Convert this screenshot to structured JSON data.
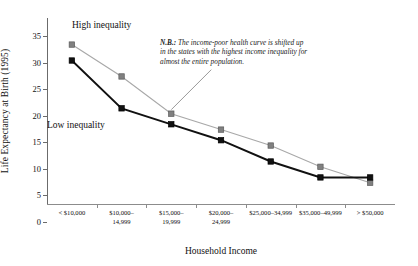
{
  "chart_data": {
    "type": "line",
    "title": "",
    "xlabel": "Household Income",
    "ylabel": "Life Expectancy at Birth (1995)",
    "ylim": [
      0,
      35
    ],
    "ytick_step": 5,
    "yticks": [
      "0",
      "5",
      "10",
      "15",
      "20",
      "25",
      "30",
      "35"
    ],
    "grid": false,
    "legend": "inline-labels",
    "categories": [
      "< $10,000",
      "$10,000–\n14,999",
      "$15,000–\n19,999",
      "$20,000–\n24,999",
      "$25,000–34,999",
      "$35,000–49,999",
      "> $50,000"
    ],
    "categories_flat": [
      "< $10,000",
      "$10,000–14,999",
      "$15,000–19,999",
      "$20,000–24,999",
      "$25,000–34,999",
      "$35,000–49,999",
      "> $50,000"
    ],
    "series": [
      {
        "name": "High inequality",
        "color": "#808080",
        "line_color": "#a8a8a8",
        "marker": "square",
        "values": [
          30,
          24,
          17,
          14,
          11,
          7,
          4
        ]
      },
      {
        "name": "Low inequality",
        "color": "#111111",
        "line_color": "#111111",
        "marker": "square",
        "values": [
          27,
          18,
          15,
          12,
          8,
          5,
          5
        ]
      }
    ],
    "annotations": [
      {
        "id": "nb-note",
        "prefix": "N.B.:",
        "text": " The income-poor health curve is shifted up in the states with the highest income inequality for almost the entire population.",
        "full": "N.B.: The income-poor health curve is shifted up in the states with the highest income inequality for almost the entire population.",
        "leader_to_series": "High inequality",
        "leader_to_point_index": 2
      }
    ]
  },
  "labels": {
    "high_series_tag": "High inequality",
    "low_series_tag": "Low inequality"
  }
}
